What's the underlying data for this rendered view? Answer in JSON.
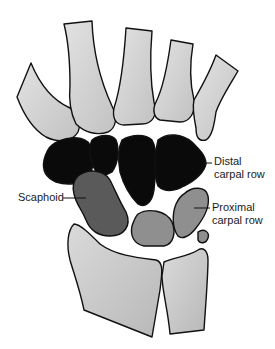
{
  "diagram": {
    "labels": {
      "distal_line1": "Distal",
      "distal_line2": "carpal row",
      "scaphoid": "Scaphoid",
      "proximal_line1": "Proximal",
      "proximal_line2": "carpal row"
    },
    "colors": {
      "metacarpal_fill": "#d4d4d4",
      "distal_row_fill": "#0a0a0a",
      "scaphoid_fill": "#5a5a5a",
      "proximal_row_fill": "#8f8f8f",
      "forearm_fill": "#cfcfcf",
      "outline": "#111111",
      "background": "#ffffff"
    }
  }
}
